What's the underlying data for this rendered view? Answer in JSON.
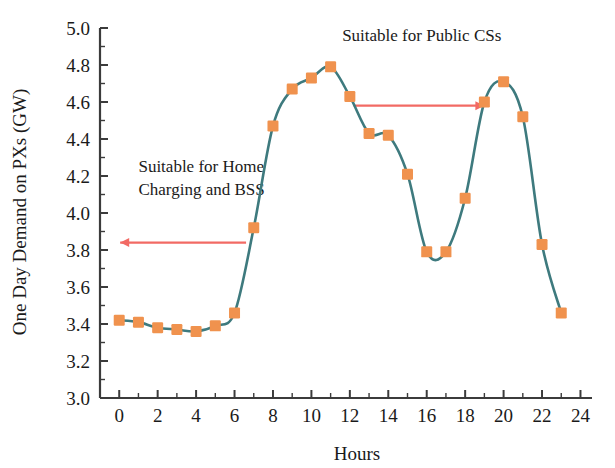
{
  "chart_data": {
    "type": "line",
    "title": "",
    "xlabel": "Hours",
    "ylabel": "One Day Demand on PXs (GW)",
    "xlim": [
      -1,
      24.6
    ],
    "ylim": [
      3.0,
      5.0
    ],
    "grid": false,
    "legend": "none",
    "x": [
      0,
      1,
      2,
      3,
      4,
      5,
      6,
      7,
      8,
      9,
      10,
      11,
      12,
      13,
      14,
      15,
      16,
      17,
      18,
      19,
      20,
      21,
      22,
      23
    ],
    "values": [
      3.42,
      3.41,
      3.38,
      3.37,
      3.36,
      3.39,
      3.46,
      3.92,
      4.47,
      4.67,
      4.73,
      4.79,
      4.63,
      4.43,
      4.42,
      4.21,
      3.79,
      3.79,
      4.08,
      4.6,
      4.71,
      4.52,
      3.83,
      3.46
    ],
    "series": [
      {
        "name": "One Day Demand on PXs",
        "marker": "square",
        "marker_color": "#F0924E",
        "line_color": "#3E7A7E",
        "values": [
          3.42,
          3.41,
          3.38,
          3.37,
          3.36,
          3.39,
          3.46,
          3.92,
          4.47,
          4.67,
          4.73,
          4.79,
          4.63,
          4.43,
          4.42,
          4.21,
          3.79,
          3.79,
          4.08,
          4.6,
          4.71,
          4.52,
          3.83,
          3.46
        ]
      }
    ],
    "x_ticks": [
      0,
      2,
      4,
      6,
      8,
      10,
      12,
      14,
      16,
      18,
      20,
      22,
      24
    ],
    "x_tick_labels": [
      "0",
      "2",
      "4",
      "6",
      "8",
      "10",
      "12",
      "14",
      "16",
      "18",
      "20",
      "22",
      "24"
    ],
    "x_minor_ticks": [
      1,
      3,
      5,
      7,
      9,
      11,
      13,
      15,
      17,
      19,
      21,
      23
    ],
    "y_ticks": [
      3.0,
      3.2,
      3.4,
      3.6,
      3.8,
      4.0,
      4.2,
      4.4,
      4.6,
      4.8,
      5.0
    ],
    "y_tick_labels": [
      "3.0",
      "3.2",
      "3.4",
      "3.6",
      "3.8",
      "4.0",
      "4.2",
      "4.4",
      "4.6",
      "4.8",
      "5.0"
    ],
    "y_minor_ticks": [
      3.1,
      3.3,
      3.5,
      3.7,
      3.9,
      4.1,
      4.3,
      4.5,
      4.7,
      4.9
    ],
    "annotations": [
      {
        "id": "home-charging",
        "text_line1": "Suitable for Home",
        "text_line2": "Charging and BSS",
        "text_x": 1.0,
        "text_y": 4.22,
        "arrow_color": "#F26A64",
        "arrow_y": 3.84,
        "arrow_x_start": 6.6,
        "arrow_x_end": 0.05,
        "arrow_head": "start"
      },
      {
        "id": "public-cs",
        "text_line1": "Suitable for Public CSs",
        "text_line2": "",
        "text_x": 11.6,
        "text_y": 4.93,
        "arrow_color": "#F26A64",
        "arrow_y": 4.58,
        "arrow_x_start": 12.2,
        "arrow_x_end": 19.0,
        "arrow_head": "end"
      }
    ]
  },
  "colors": {
    "marker": "#F0924E",
    "line": "#3E7A7E",
    "annotation": "#F26A64",
    "axis": "#3b3b3b",
    "text": "#1a1a1a",
    "background": "#ffffff"
  },
  "axis_labels": {
    "x_title": "Hours",
    "y_title": "One Day Demand on PXs (GW)"
  }
}
